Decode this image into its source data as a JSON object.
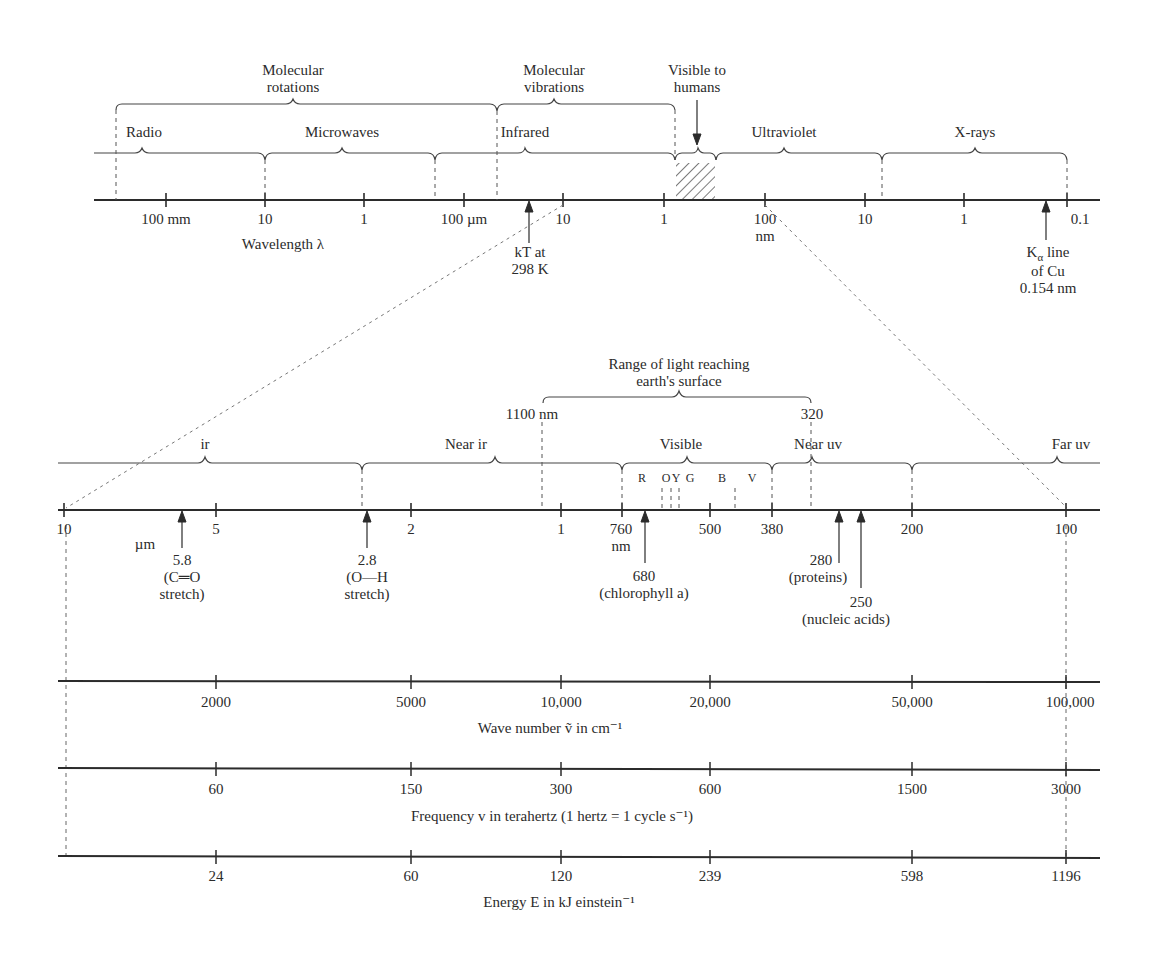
{
  "top_spectrum": {
    "groups": {
      "molecular_rotations": "Molecular\nrotations",
      "molecular_vibrations": "Molecular\nvibrations",
      "visible_to_humans": "Visible to\nhumans"
    },
    "regions": [
      "Radio",
      "Microwaves",
      "Infrared",
      "Ultraviolet",
      "X-rays"
    ],
    "ticks": [
      "100 mm",
      "10",
      "1",
      "100 µm",
      "10",
      "1",
      "100",
      "10",
      "1",
      "0.1"
    ],
    "tick_unit_nm": "nm",
    "axis_label": "Wavelength λ",
    "annotations": {
      "kT": "kT at\n298 K",
      "kalpha_line1": "line",
      "kalpha_K": "K",
      "kalpha_sub": "α",
      "kalpha_rest": "of Cu\n0.154 nm"
    }
  },
  "middle_spectrum": {
    "range_label": "Range of light reaching\nearth's surface",
    "range_start": "1100 nm",
    "range_end": "320",
    "regions": [
      "ir",
      "Near ir",
      "Visible",
      "Near uv",
      "Far uv"
    ],
    "colors": [
      "R",
      "O",
      "Y",
      "G",
      "B",
      "V"
    ],
    "ticks": [
      "10",
      "5",
      "2",
      "1",
      "760",
      "500",
      "380",
      "200",
      "100"
    ],
    "unit_um": "µm",
    "unit_nm": "nm",
    "annotations": [
      {
        "value": "5.8",
        "desc": "(C═O\nstretch)"
      },
      {
        "value": "2.8",
        "desc": "(O—H\nstretch)"
      },
      {
        "value": "680",
        "desc": "(chlorophyll a)"
      },
      {
        "value": "280",
        "desc": "(proteins)"
      },
      {
        "value": "250",
        "desc": "(nucleic acids)"
      }
    ]
  },
  "wave_number_axis": {
    "ticks": [
      "2000",
      "5000",
      "10,000",
      "20,000",
      "50,000",
      "100,000"
    ],
    "label": "Wave number ṽ in cm⁻¹"
  },
  "frequency_axis": {
    "ticks": [
      "60",
      "150",
      "300",
      "600",
      "1500",
      "3000"
    ],
    "label": "Frequency v in terahertz (1 hertz = 1 cycle s⁻¹)"
  },
  "energy_axis": {
    "ticks": [
      "24",
      "60",
      "120",
      "239",
      "598",
      "1196"
    ],
    "label": "Energy E in kJ einstein⁻¹"
  },
  "colors": {
    "ink": "#2b2b2b",
    "dashed": "#666666"
  }
}
